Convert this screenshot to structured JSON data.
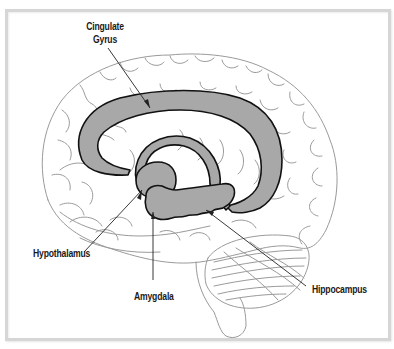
{
  "diagram": {
    "colors": {
      "frame": "#d6d6d6",
      "brain_outline": "#9a9a9a",
      "structure_fill": "#a8a8a8",
      "structure_stroke": "#111111",
      "label_text": "#1a1a1a",
      "leader_line": "#222222"
    },
    "labels": {
      "cingulate_gyrus_line1": "Cingulate",
      "cingulate_gyrus_line2": "Gyrus",
      "hypothalamus": "Hypothalamus",
      "amygdala": "Amygdala",
      "hippocampus": "Hippocampus"
    }
  }
}
